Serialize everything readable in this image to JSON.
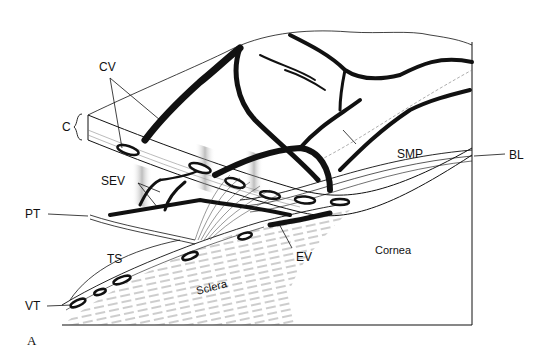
{
  "figure": {
    "panel_label": "A",
    "labels": {
      "cv": "CV",
      "c": "C",
      "sev": "SEV",
      "pt": "PT",
      "ts": "TS",
      "vt": "VT",
      "sclera": "Sclera",
      "ev": "EV",
      "cornea": "Cornea",
      "smp": "SMP",
      "bl": "BL"
    },
    "colors": {
      "ink": "#111111",
      "background": "#ffffff",
      "stipple": "#9a9a9a"
    }
  }
}
